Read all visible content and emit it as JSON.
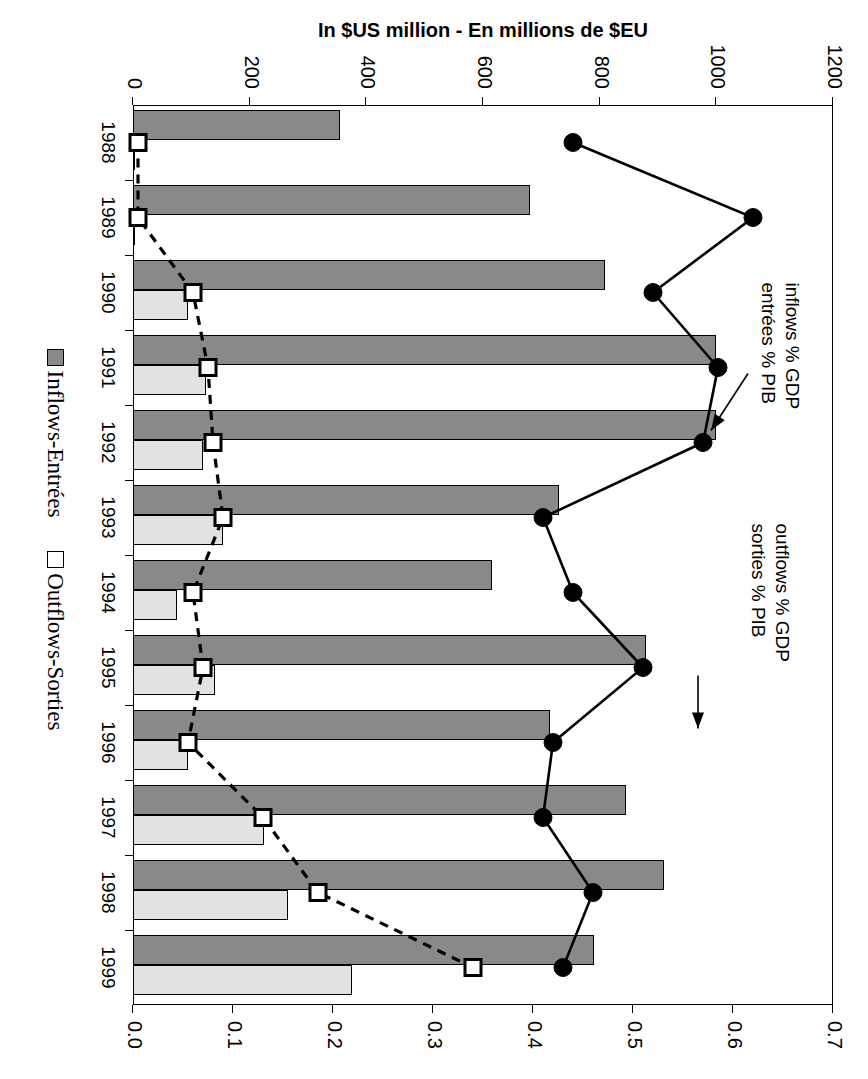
{
  "chart_data": {
    "type": "bar",
    "title": "",
    "subtitle": "",
    "xlabel": "",
    "ylabel": "In $US million - En millions de $EU",
    "y2label": "",
    "categories": [
      "1988",
      "1989",
      "1990",
      "1991",
      "1992",
      "1993",
      "1994",
      "1995",
      "1996",
      "1997",
      "1998",
      "1999"
    ],
    "ylim": [
      0,
      1200
    ],
    "y2lim": [
      0,
      0.7
    ],
    "yticks": [
      "0",
      "200",
      "400",
      "600",
      "800",
      "1000",
      "1200"
    ],
    "ytick_values": [
      0,
      200,
      400,
      600,
      800,
      1000,
      1200
    ],
    "y2ticks": [
      "0.0",
      "0.1",
      "0.2",
      "0.3",
      "0.4",
      "0.5",
      "0.6",
      "0.7"
    ],
    "y2tick_values": [
      0.0,
      0.1,
      0.2,
      0.3,
      0.4,
      0.5,
      0.6,
      0.7
    ],
    "grid": false,
    "legend_position": "bottom",
    "series": [
      {
        "name": "Inflows-Entrées",
        "type": "bar",
        "axis": "left",
        "color": "#898989",
        "values": [
          355,
          680,
          810,
          1000,
          1000,
          730,
          615,
          880,
          715,
          845,
          910,
          790
        ]
      },
      {
        "name": "Outflows-Sorties",
        "type": "bar",
        "axis": "left",
        "color": "#e2e2e2",
        "values": [
          2,
          3,
          95,
          125,
          120,
          155,
          75,
          140,
          95,
          225,
          265,
          375
        ]
      },
      {
        "name": "inflows % GDP / entrées % PIB",
        "type": "line",
        "axis": "right",
        "color": "#000000",
        "marker": "circle",
        "linestyle": "solid",
        "values": [
          0.44,
          0.62,
          0.52,
          0.585,
          0.57,
          0.41,
          0.44,
          0.51,
          0.42,
          0.41,
          0.46,
          0.43
        ]
      },
      {
        "name": "outflows % GDP / sorties % PIB",
        "type": "line",
        "axis": "right",
        "color": "#000000",
        "marker": "square-open",
        "linestyle": "dashed",
        "values": [
          0.005,
          0.005,
          0.06,
          0.075,
          0.08,
          0.09,
          0.06,
          0.07,
          0.055,
          0.13,
          0.185,
          0.34
        ]
      }
    ],
    "annotations": [
      {
        "id": "inflows",
        "line1": "inflows % GDP",
        "line2": "entrées % PIB",
        "points_to_year": "1992"
      },
      {
        "id": "outflows",
        "line1": "outflows % GDP",
        "line2": "sorties % PIB",
        "points_to_year": "1996"
      }
    ]
  },
  "axes": {
    "y_title": "In $US million - En millions de $EU",
    "y_ticks": [
      "0",
      "200",
      "400",
      "600",
      "800",
      "1000",
      "1200"
    ],
    "y2_ticks": [
      "0.0",
      "0.1",
      "0.2",
      "0.3",
      "0.4",
      "0.5",
      "0.6",
      "0.7"
    ],
    "x_ticks": [
      "1988",
      "1989",
      "1990",
      "1991",
      "1992",
      "1993",
      "1994",
      "1995",
      "1996",
      "1997",
      "1998",
      "1999"
    ]
  },
  "legend": {
    "items": [
      {
        "label": "Inflows-Entrées",
        "swatch": "dark-gray"
      },
      {
        "label": "Outflows-Sorties",
        "swatch": "white"
      }
    ]
  },
  "annotations": {
    "inflows_l1": "inflows % GDP",
    "inflows_l2": "entrées % PIB",
    "outflows_l1": "outflows % GDP",
    "outflows_l2": "sorties % PIB"
  }
}
